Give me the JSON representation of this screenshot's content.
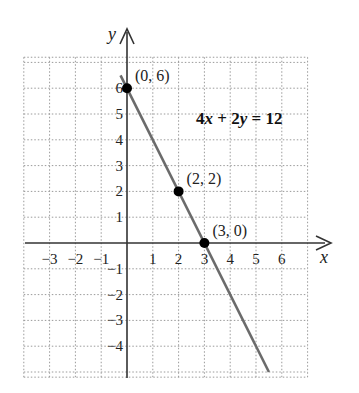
{
  "chart_data": {
    "type": "line",
    "title": "",
    "equation": "4x + 2y = 12",
    "equation_parts": {
      "a": "4",
      "x": "x",
      "plus": " + ",
      "b": "2",
      "y": "y",
      "eq": " = 12"
    },
    "xlabel": "x",
    "ylabel": "y",
    "xlim": [
      -4,
      7
    ],
    "ylim": [
      -5,
      7
    ],
    "grid": true,
    "x_ticks": [
      -3,
      -2,
      -1,
      1,
      2,
      3,
      4,
      5,
      6
    ],
    "x_tick_labels": [
      "−3",
      "−2",
      "−1",
      "1",
      "2",
      "3",
      "4",
      "5",
      "6"
    ],
    "y_ticks": [
      6,
      5,
      4,
      3,
      2,
      1,
      -1,
      -2,
      -3,
      -4
    ],
    "y_tick_labels": [
      "6",
      "5",
      "4",
      "3",
      "2",
      "1",
      "−1",
      "−2",
      "−3",
      "−4"
    ],
    "series": [
      {
        "name": "4x + 2y = 12",
        "x": [
          -0.25,
          5.5
        ],
        "y": [
          6.5,
          -5
        ],
        "color": "#6b6b6b"
      }
    ],
    "points": [
      {
        "x": 0,
        "y": 6,
        "label": "(0, 6)"
      },
      {
        "x": 2,
        "y": 2,
        "label": "(2, 2)"
      },
      {
        "x": 3,
        "y": 0,
        "label": "(3, 0)"
      }
    ],
    "colors": {
      "line": "#6b6b6b",
      "axis": "#333333",
      "grid": "#9a9a9a",
      "point": "#000000"
    }
  }
}
